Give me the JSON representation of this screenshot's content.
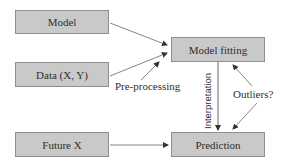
{
  "diagram": {
    "nodes": [
      {
        "id": "model",
        "label": "Model"
      },
      {
        "id": "data",
        "label": "Data (X, Y)"
      },
      {
        "id": "future_x",
        "label": "Future X"
      },
      {
        "id": "model_fitting",
        "label": "Model fitting"
      },
      {
        "id": "prediction",
        "label": "Prediction"
      }
    ],
    "edge_labels": {
      "preprocessing": "Pre-processing",
      "interpretation": "Interpretation",
      "outliers": "Outliers?"
    },
    "edges": [
      {
        "from": "model",
        "to": "model_fitting"
      },
      {
        "from": "data",
        "to": "model_fitting"
      },
      {
        "from": "preprocessing",
        "to": "model_fitting"
      },
      {
        "from": "model_fitting",
        "to": "prediction",
        "label": "Interpretation"
      },
      {
        "from": "outliers",
        "to": "model_fitting"
      },
      {
        "from": "outliers",
        "to": "prediction"
      },
      {
        "from": "future_x",
        "to": "prediction"
      }
    ],
    "colors": {
      "box_fill": "#c9c9c9",
      "box_border": "#8e8e8e",
      "arrow": "#333333",
      "text": "#2e2e2e"
    }
  }
}
